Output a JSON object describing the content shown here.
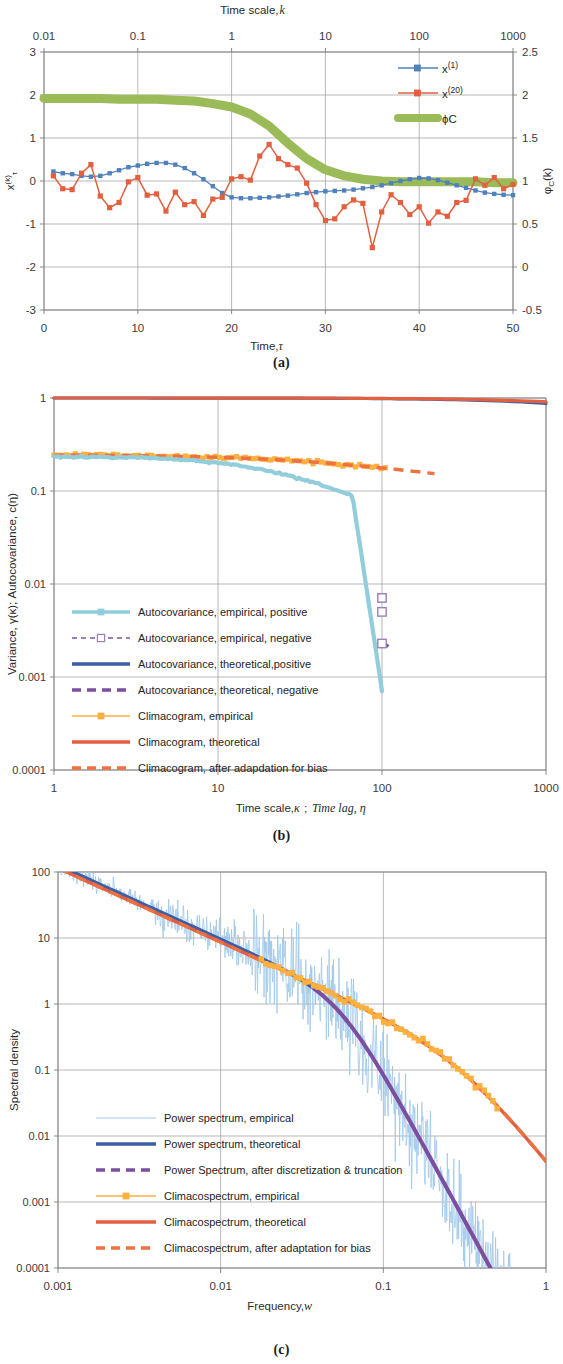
{
  "figure": {
    "panels": [
      {
        "id": "a",
        "caption": "(a)"
      },
      {
        "id": "b",
        "caption": "(b)"
      },
      {
        "id": "c",
        "caption": "(c)"
      }
    ]
  },
  "colors": {
    "blue_series": "#4f81bd",
    "orange_series": "#e2603f",
    "green_series": "#9bbb59",
    "light_blue": "#92cddc",
    "dark_blue": "#3a5fa8",
    "purple": "#7b4ea0",
    "light_orange": "#fbb040",
    "red_orange": "#e2603f",
    "grid": "#9a9a9a",
    "frame": "#7d7d7d"
  },
  "chart_data": [
    {
      "type": "line",
      "panel": "a",
      "title": "",
      "xlabel": "Time, τ",
      "xlabel_top": "Time scale, k",
      "ylabel": "x⁽ᵏ⁾ᵩ",
      "ylabel_right": "φＣ(k)",
      "xlim": [
        0,
        50
      ],
      "xticks": [
        0,
        10,
        20,
        30,
        40,
        50
      ],
      "ylim": [
        -3,
        3
      ],
      "yticks": [
        -3,
        -2,
        -1,
        0,
        1,
        2,
        3
      ],
      "ylim_right": [
        -0.5,
        2.5
      ],
      "yticks_right": [
        -0.5,
        0,
        0.5,
        1,
        1.5,
        2,
        2.5
      ],
      "xticks_top": [
        "0.01",
        "0.1",
        "1",
        "10",
        "100",
        "1000"
      ],
      "xlim_top_log": [
        -2,
        3
      ],
      "grid": true,
      "legend_position": "top-right",
      "series": [
        {
          "name": "x⁽¹⁾",
          "legend": "x(1)",
          "color": "#4f81bd",
          "axis": "left",
          "marker": "square",
          "x": [
            1,
            2,
            3,
            4,
            5,
            6,
            7,
            8,
            9,
            10,
            11,
            12,
            13,
            14,
            15,
            16,
            17,
            18,
            19,
            20,
            21,
            22,
            23,
            24,
            25,
            26,
            27,
            28,
            29,
            30,
            31,
            32,
            33,
            34,
            35,
            36,
            37,
            38,
            39,
            40,
            41,
            42,
            43,
            44,
            45,
            46,
            47,
            48,
            49,
            50
          ],
          "values": [
            0.22,
            0.18,
            0.16,
            0.12,
            0.1,
            0.12,
            0.18,
            0.25,
            0.32,
            0.36,
            0.4,
            0.42,
            0.42,
            0.38,
            0.3,
            0.18,
            0.04,
            -0.12,
            -0.28,
            -0.38,
            -0.4,
            -0.4,
            -0.39,
            -0.38,
            -0.36,
            -0.34,
            -0.31,
            -0.28,
            -0.26,
            -0.24,
            -0.23,
            -0.22,
            -0.2,
            -0.17,
            -0.14,
            -0.1,
            -0.05,
            0.0,
            0.04,
            0.07,
            0.06,
            0.02,
            -0.04,
            -0.1,
            -0.16,
            -0.22,
            -0.27,
            -0.3,
            -0.32,
            -0.33
          ]
        },
        {
          "name": "x⁽²⁰⁾",
          "legend": "x(20)",
          "color": "#e2603f",
          "axis": "left",
          "marker": "square",
          "x": [
            1,
            2,
            3,
            4,
            5,
            6,
            7,
            8,
            9,
            10,
            11,
            12,
            13,
            14,
            15,
            16,
            17,
            18,
            19,
            20,
            21,
            22,
            23,
            24,
            25,
            26,
            27,
            28,
            29,
            30,
            31,
            32,
            33,
            34,
            35,
            36,
            37,
            38,
            39,
            40,
            41,
            42,
            43,
            44,
            45,
            46,
            47,
            48,
            49,
            50
          ],
          "values": [
            0.12,
            -0.18,
            -0.2,
            0.18,
            0.38,
            -0.35,
            -0.62,
            -0.5,
            -0.02,
            0.08,
            -0.33,
            -0.3,
            -0.7,
            -0.26,
            -0.55,
            -0.48,
            -0.8,
            -0.42,
            -0.38,
            0.05,
            0.1,
            0.02,
            0.58,
            0.85,
            0.52,
            0.38,
            0.3,
            -0.05,
            -0.55,
            -0.92,
            -0.88,
            -0.6,
            -0.44,
            -0.52,
            -1.55,
            -0.72,
            -0.32,
            -0.5,
            -0.78,
            -0.6,
            -0.98,
            -0.72,
            -0.82,
            -0.5,
            -0.45,
            0.05,
            -0.1,
            0.08,
            -0.18,
            -0.08
          ]
        },
        {
          "name": "ΦC",
          "legend": "ϕC",
          "color": "#9bbb59",
          "axis": "right-log",
          "marker": "none",
          "thick": true,
          "x_log": [
            -2,
            -1.8,
            -1.6,
            -1.4,
            -1.2,
            -1.0,
            -0.8,
            -0.6,
            -0.4,
            -0.2,
            0.0,
            0.2,
            0.4,
            0.6,
            0.8,
            1.0,
            1.2,
            1.4,
            1.6,
            1.8,
            2.0,
            2.2,
            2.4,
            2.6,
            2.8,
            3.0
          ],
          "values": [
            1.96,
            1.96,
            1.96,
            1.96,
            1.95,
            1.95,
            1.95,
            1.94,
            1.93,
            1.9,
            1.86,
            1.78,
            1.64,
            1.44,
            1.26,
            1.13,
            1.06,
            1.02,
            1.0,
            0.99,
            0.99,
            0.99,
            0.99,
            0.99,
            0.98,
            0.98
          ]
        }
      ]
    },
    {
      "type": "line",
      "panel": "b",
      "title": "",
      "xlabel": "Time scale, κ; Time lag, η",
      "ylabel": "Variance, γ(κ); Autocovariance, c(η)",
      "xlim_log": [
        0,
        3
      ],
      "xticks": [
        "1",
        "10",
        "100",
        "1000"
      ],
      "ylim_log": [
        -4,
        0
      ],
      "yticks": [
        "0.0001",
        "0.001",
        "0.01",
        "0.1",
        "1"
      ],
      "grid": true,
      "legend_position": "lower-left",
      "series": [
        {
          "name": "Autocovariance, empirical, positive",
          "color": "#92cddc",
          "style": "solid-thick",
          "marker": "square-small"
        },
        {
          "name": "Autocovariance, empirical, negative",
          "color": "#9a7fb8",
          "style": "dashed",
          "marker": "square-open"
        },
        {
          "name": "Autocovariance, theoretical,positive",
          "color": "#3a5fa8",
          "style": "solid-thick",
          "marker": "none"
        },
        {
          "name": "Autocovariance, theoretical, negative",
          "color": "#7b4ea0",
          "style": "dashed-thick",
          "marker": "none"
        },
        {
          "name": "Climacogram, empirical",
          "color": "#fbb040",
          "style": "solid",
          "marker": "square-small"
        },
        {
          "name": "Climacogram, theoretical",
          "color": "#e2603f",
          "style": "solid-thick",
          "marker": "none"
        },
        {
          "name": "Climacogram, after adapdation for bias",
          "color": "#f0713f",
          "style": "dashed-thick",
          "marker": "none"
        }
      ]
    },
    {
      "type": "line",
      "panel": "c",
      "title": "",
      "xlabel": "Frequency, w",
      "ylabel": "Spectral density",
      "xlim_log": [
        -3,
        0
      ],
      "xticks": [
        "0.001",
        "0.01",
        "0.1",
        "1"
      ],
      "ylim_log": [
        -4,
        2
      ],
      "yticks": [
        "0.0001",
        "0.001",
        "0.01",
        "0.1",
        "1",
        "10",
        "100"
      ],
      "grid": true,
      "legend_position": "lower-left",
      "series": [
        {
          "name": "Power spectrum, empirical",
          "color": "#9ec6e8",
          "style": "thin",
          "marker": "none"
        },
        {
          "name": "Power spectrum, theoretical",
          "color": "#3a5fa8",
          "style": "solid-thick",
          "marker": "none"
        },
        {
          "name": "Power Spectrum, after discretization & truncation",
          "color": "#7b4ea0",
          "style": "dashed-thick",
          "marker": "none"
        },
        {
          "name": "Climacospectrum, empirical",
          "color": "#fbb040",
          "style": "solid",
          "marker": "square-small"
        },
        {
          "name": "Climacospectrum, theoretical",
          "color": "#e2603f",
          "style": "solid-thick",
          "marker": "none"
        },
        {
          "name": "Climacospectrum, after adaptation for bias",
          "color": "#f0713f",
          "style": "dashed-thick",
          "marker": "none"
        }
      ]
    }
  ]
}
